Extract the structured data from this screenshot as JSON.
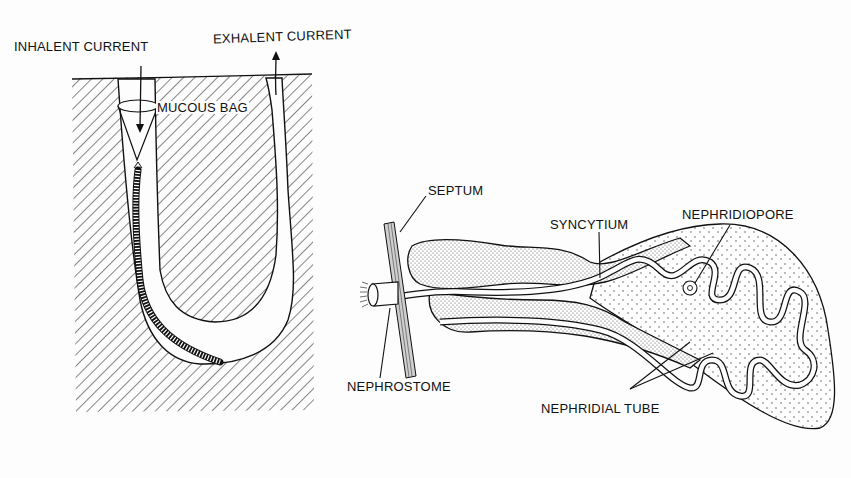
{
  "figure": {
    "panels": [
      {
        "id": "burrow",
        "description": "Worm in U-shaped burrow with mucous feeding bag",
        "labels": {
          "inhalent_current": "INHALENT CURRENT",
          "exhalent_current": "EXHALENT CURRENT",
          "mucous_bag": "MUCOUS BAG"
        }
      },
      {
        "id": "nephridium",
        "description": "Nephridium passing through septum",
        "labels": {
          "septum": "SEPTUM",
          "syncytium": "SYNCYTIUM",
          "nephridiopore": "NEPHRIDIOPORE",
          "nephrostome": "NEPHROSTOME",
          "nephridial_tube": "NEPHRIDIAL TUBE"
        }
      }
    ]
  },
  "colors": {
    "ink": "#111111",
    "paper": "#fdfdfd",
    "stipple": "#555555"
  }
}
